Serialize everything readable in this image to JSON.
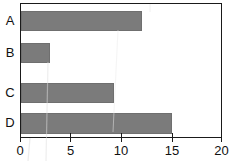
{
  "chart_data": {
    "type": "bar",
    "orientation": "horizontal",
    "title": "",
    "subtitle": "",
    "xlabel": "",
    "ylabel": "",
    "categories": [
      "A",
      "B",
      "C",
      "D"
    ],
    "values": [
      12.0,
      2.9,
      9.2,
      15.0
    ],
    "series": [
      {
        "name": "",
        "values": [
          12.0,
          2.9,
          9.2,
          15.0
        ]
      }
    ],
    "xlim": [
      0,
      20
    ],
    "xticks": [
      0,
      5,
      10,
      15,
      20
    ],
    "xtick_labels": [
      "0",
      "5",
      "10",
      "15",
      "20"
    ],
    "yticks": [
      "A",
      "B",
      "C",
      "D"
    ],
    "grid": false,
    "legend": false,
    "legend_position": "none",
    "annotations": [],
    "bar_color": "#7b7b7b",
    "axis_color": "#1a1a1a",
    "background_color": "#ffffff"
  },
  "axis": {
    "x_tick_0": "0",
    "x_tick_1": "5",
    "x_tick_2": "10",
    "x_tick_3": "15",
    "x_tick_4": "20"
  },
  "categories": {
    "a": "A",
    "b": "B",
    "c": "C",
    "d": "D"
  }
}
